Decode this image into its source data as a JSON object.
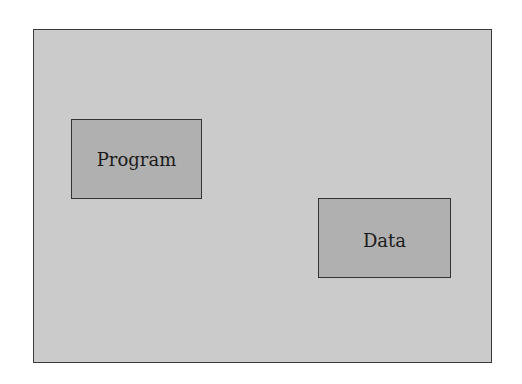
{
  "diagram": {
    "container": {
      "label": ""
    },
    "nodes": [
      {
        "id": "program",
        "label": "Program"
      },
      {
        "id": "data",
        "label": "Data"
      }
    ],
    "colors": {
      "container_fill": "#cbcbcb",
      "node_fill": "#b0b0b0",
      "border": "#333333"
    }
  }
}
